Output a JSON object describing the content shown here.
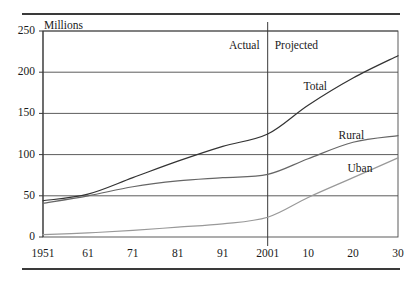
{
  "figure": {
    "units_label": "Millions",
    "period_labels": [
      {
        "name": "actual",
        "text": "Actual"
      },
      {
        "name": "projected",
        "text": "Projected"
      }
    ]
  },
  "chart_data": {
    "type": "line",
    "title": "",
    "subtitle": "",
    "xlabel": "",
    "ylabel": "Millions",
    "grid": true,
    "legend_position": "inline-right",
    "xlim": [
      1951,
      2030
    ],
    "ylim": [
      0,
      250
    ],
    "yticks": [
      0,
      50,
      100,
      150,
      200,
      250
    ],
    "ytick_labels": [
      "0",
      "50",
      "100",
      "150",
      "200",
      "250"
    ],
    "xticks": [
      1951,
      1961,
      1971,
      1981,
      1991,
      2001,
      2010,
      2020,
      2030
    ],
    "xtick_labels": [
      "1951",
      "61",
      "71",
      "81",
      "91",
      "2001",
      "10",
      "20",
      "30"
    ],
    "divider": {
      "x": 2001,
      "label_left": "Actual",
      "label_right": "Projected"
    },
    "x": [
      1951,
      1961,
      1971,
      1981,
      1991,
      2001,
      2010,
      2020,
      2030
    ],
    "series": [
      {
        "name": "Total",
        "label": "Total",
        "color": "#333333",
        "values": [
          44,
          52,
          72,
          92,
          110,
          125,
          160,
          193,
          220
        ]
      },
      {
        "name": "Rural",
        "label": "Rural",
        "color": "#666666",
        "values": [
          41,
          50,
          61,
          68,
          72,
          76,
          95,
          115,
          123
        ]
      },
      {
        "name": "Uban",
        "label": "Uban",
        "color": "#999999",
        "values": [
          3,
          5,
          8,
          12,
          16,
          24,
          48,
          72,
          96
        ]
      }
    ]
  }
}
